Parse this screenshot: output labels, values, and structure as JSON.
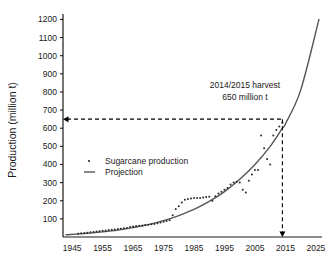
{
  "chart_data": {
    "type": "scatter",
    "title": "",
    "xlabel": "",
    "ylabel": "Production (million t)",
    "xlim": [
      1942,
      2027
    ],
    "ylim": [
      0,
      1230
    ],
    "grid": false,
    "legend_position": "inside-left-middle",
    "xticks": [
      1945,
      1955,
      1965,
      1975,
      1985,
      1995,
      2005,
      2015,
      2025
    ],
    "yticks": [
      100,
      200,
      300,
      400,
      500,
      600,
      700,
      800,
      900,
      1000,
      1100,
      1200
    ],
    "series": [
      {
        "name": "Sugarcane production",
        "marker": "dot",
        "x": [
          1947,
          1948,
          1949,
          1950,
          1951,
          1952,
          1953,
          1954,
          1955,
          1956,
          1957,
          1958,
          1959,
          1960,
          1961,
          1962,
          1963,
          1964,
          1965,
          1966,
          1967,
          1968,
          1969,
          1970,
          1971,
          1972,
          1973,
          1974,
          1975,
          1976,
          1977,
          1978,
          1979,
          1980,
          1981,
          1982,
          1983,
          1984,
          1985,
          1986,
          1987,
          1988,
          1989,
          1990,
          1991,
          1992,
          1993,
          1994,
          1995,
          1996,
          1997,
          1998,
          1999,
          2000,
          2001,
          2002,
          2003,
          2004,
          2005,
          2006,
          2007,
          2008,
          2009,
          2010,
          2011,
          2012,
          2013,
          2014
        ],
        "y": [
          18,
          20,
          22,
          24,
          26,
          28,
          30,
          32,
          34,
          36,
          38,
          40,
          42,
          44,
          46,
          48,
          50,
          55,
          58,
          60,
          62,
          64,
          66,
          68,
          70,
          72,
          76,
          80,
          84,
          88,
          92,
          120,
          155,
          170,
          190,
          205,
          210,
          212,
          215,
          215,
          215,
          218,
          220,
          222,
          200,
          225,
          240,
          250,
          260,
          270,
          290,
          300,
          305,
          300,
          260,
          245,
          310,
          345,
          370,
          370,
          560,
          490,
          430,
          400,
          560,
          590,
          610,
          630
        ]
      },
      {
        "name": "Projection",
        "marker": "line",
        "x": [
          1943,
          1950,
          1955,
          1960,
          1965,
          1970,
          1975,
          1980,
          1985,
          1990,
          1995,
          2000,
          2005,
          2010,
          2014,
          2015,
          2020,
          2026
        ],
        "y": [
          12,
          20,
          28,
          38,
          52,
          68,
          90,
          118,
          152,
          196,
          250,
          318,
          400,
          500,
          600,
          625,
          810,
          1200
        ]
      }
    ],
    "annotations": [
      {
        "name": "harvest-callout",
        "line1": "2014/2015 harvest",
        "line2": "650 million t",
        "x": 2014,
        "y": 650,
        "guide_value_y": 650,
        "guide_value_x": 2014
      }
    ]
  },
  "legend": {
    "items": [
      {
        "label": "Sugarcane production",
        "marker": "dot"
      },
      {
        "label": "Projection",
        "marker": "line"
      }
    ]
  },
  "axis": {
    "y_title": "Production (million t)",
    "y_tick_labels": [
      "1200",
      "1100",
      "1000",
      "900",
      "800",
      "700",
      "600",
      "500",
      "400",
      "300",
      "200",
      "100"
    ],
    "x_tick_labels": [
      "1945",
      "1955",
      "1965",
      "1975",
      "1985",
      "1995",
      "2005",
      "2015",
      "2025"
    ]
  },
  "annotation": {
    "line1": "2014/2015 harvest",
    "line2": "650 million t"
  },
  "colors": {
    "axis": "#1a1a1a",
    "curve": "#555555",
    "points": "#2b2b2b",
    "guide": "#000000",
    "background": "#ffffff"
  }
}
